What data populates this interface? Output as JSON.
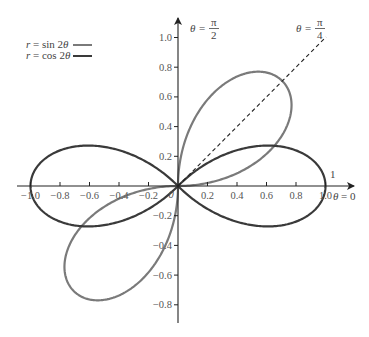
{
  "chart_data": {
    "type": "line",
    "subtype": "polar-curves",
    "title": "",
    "xlabel": "",
    "ylabel": "",
    "xlim": [
      -1.1,
      1.1
    ],
    "ylim": [
      -0.95,
      1.1
    ],
    "grid": false,
    "legend_position": "top-left",
    "x_ticks": [
      -1.0,
      -0.8,
      -0.6,
      -0.4,
      -0.2,
      0.2,
      0.4,
      0.6,
      0.8,
      1.0
    ],
    "x_tick_labels": [
      "-1.0",
      "-0.8",
      "-0.6",
      "-0.4",
      "-0.2",
      "0.2",
      "0.4",
      "0.6",
      "0.8",
      "1.0"
    ],
    "y_ticks": [
      1.0,
      0.8,
      0.6,
      0.4,
      0.2,
      -0.2,
      -0.4,
      -0.6,
      -0.8
    ],
    "y_tick_labels": [
      "1.0",
      "0.8",
      "0.6",
      "0.4",
      "0.2",
      "-0.2",
      "-0.4",
      "-0.6",
      "-0.8"
    ],
    "origin_label": "0",
    "series": [
      {
        "name": "r = sin 2θ",
        "legend_label": "r = sin 2θ",
        "equation": "r = sin(2θ)",
        "color": "#7a7a7a",
        "domain_drawn": [
          [
            0,
            1.5708
          ],
          [
            3.1416,
            4.7124
          ]
        ],
        "max_r": 1.0,
        "peak_angles": [
          "π/4",
          "5π/4"
        ]
      },
      {
        "name": "r = cos 2θ",
        "legend_label": "r = cos 2θ",
        "equation": "r = cos(2θ)",
        "color": "#3a3a3a",
        "domain_drawn": [
          [
            -0.7854,
            0.7854
          ],
          [
            2.3562,
            3.927
          ]
        ],
        "max_r": 1.0,
        "peak_angles": [
          "0",
          "π"
        ]
      }
    ],
    "annotations": [
      {
        "text": "θ = π/2",
        "numerator": "π",
        "denominator": "2",
        "prefix": "θ =",
        "position": "top of y-axis"
      },
      {
        "text": "θ = π/4",
        "numerator": "π",
        "denominator": "4",
        "prefix": "θ =",
        "position": "end of dashed ray at 45°"
      },
      {
        "text": "θ = 0",
        "prefix": "θ = 0",
        "position": "right end of x-axis"
      },
      {
        "text": "1",
        "position": "above x-axis near x = 1.0"
      }
    ],
    "reference_lines": [
      {
        "type": "dashed-ray",
        "angle": "π/4",
        "from_r": 0,
        "to_r": 1.42
      }
    ]
  }
}
